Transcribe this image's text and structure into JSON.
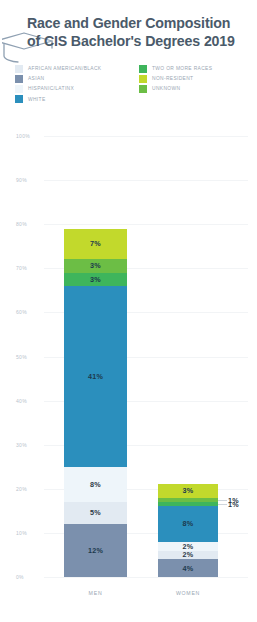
{
  "header": {
    "title_line1": "Race and Gender Composition",
    "title_line2": "of CIS Bachelor's Degrees 2019",
    "icon": "graduation-cap-icon"
  },
  "legend": {
    "left": [
      {
        "label": "AFRICAN AMERICAN/BLACK",
        "color": "#e2eaf2"
      },
      {
        "label": "ASIAN",
        "color": "#7b90ad"
      },
      {
        "label": "HISPANIC/LATINX",
        "color": "#eef5fa"
      },
      {
        "label": "WHITE",
        "color": "#2b8fbd"
      }
    ],
    "right": [
      {
        "label": "TWO OR MORE RACES",
        "color": "#3eb55c"
      },
      {
        "label": "NON-RESIDENT",
        "color": "#c2d92c"
      },
      {
        "label": "UNKNOWN",
        "color": "#6cbe45"
      }
    ]
  },
  "chart_data": {
    "type": "bar",
    "subtype": "stacked-bar",
    "title": "Race and Gender Composition of CIS Bachelor's Degrees 2019",
    "xlabel": "",
    "ylabel": "",
    "ylim": [
      0,
      100
    ],
    "yticks": [
      "0%",
      "10%",
      "20%",
      "30%",
      "40%",
      "50%",
      "60%",
      "70%",
      "80%",
      "90%",
      "100%"
    ],
    "grid": true,
    "legend_position": "top",
    "categories": [
      "MEN",
      "WOMEN"
    ],
    "series": [
      {
        "name": "ASIAN",
        "color": "#7b90ad",
        "values": [
          12,
          4
        ],
        "labels": [
          "12%",
          "4%"
        ]
      },
      {
        "name": "AFRICAN AMERICAN/BLACK",
        "color": "#e2eaf2",
        "values": [
          5,
          2
        ],
        "labels": [
          "5%",
          "2%"
        ]
      },
      {
        "name": "HISPANIC/LATINX",
        "color": "#eef5fa",
        "values": [
          8,
          2
        ],
        "labels": [
          "8%",
          "2%"
        ]
      },
      {
        "name": "WHITE",
        "color": "#2b8fbd",
        "values": [
          41,
          8
        ],
        "labels": [
          "41%",
          "8%"
        ]
      },
      {
        "name": "TWO OR MORE RACES",
        "color": "#3eb55c",
        "values": [
          3,
          1
        ],
        "labels": [
          "3%",
          "1%"
        ]
      },
      {
        "name": "UNKNOWN",
        "color": "#6cbe45",
        "values": [
          3,
          1
        ],
        "labels": [
          "3%",
          "1%"
        ]
      },
      {
        "name": "NON-RESIDENT",
        "color": "#c2d92c",
        "values": [
          7,
          3
        ],
        "labels": [
          "7%",
          "3%"
        ]
      }
    ],
    "totals": [
      79,
      21
    ]
  }
}
